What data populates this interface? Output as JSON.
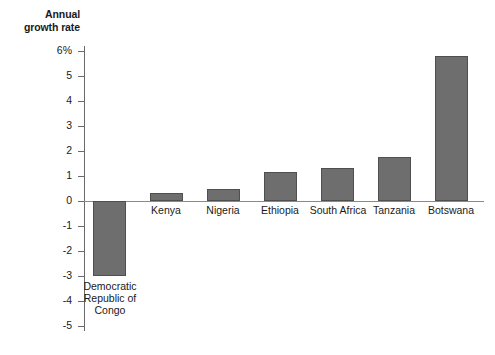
{
  "chart_data": {
    "type": "bar",
    "title": "",
    "axis_title": "Annual\ngrowth rate",
    "axis_title_line1": "Annual",
    "axis_title_line2": "growth rate",
    "xlabel": "",
    "ylabel": "Annual growth rate",
    "ylim": [
      -5,
      6
    ],
    "grid": false,
    "legend": "none",
    "bar_color": "#6e6e6e",
    "bar_edge_color": "#4f4f4f",
    "axis_color": "#6a6a6a",
    "categories": [
      "Democratic\nRepublic of\nCongo",
      "Kenya",
      "Nigeria",
      "Ethiopia",
      "South Africa",
      "Tanzania",
      "Botswana"
    ],
    "values": [
      -3.0,
      0.3,
      0.5,
      1.15,
      1.3,
      1.75,
      5.8
    ],
    "ytick_labels": [
      "6%",
      "5",
      "4",
      "3",
      "2",
      "1",
      "0",
      "-1",
      "-2",
      "-3",
      "-4",
      "-5"
    ],
    "ytick_values": [
      6,
      5,
      4,
      3,
      2,
      1,
      0,
      -1,
      -2,
      -3,
      -4,
      -5
    ]
  },
  "bars": [
    {
      "name": "democratic-republic-of-congo",
      "label": "Democratic\nRepublic of\nCongo",
      "value": -3.0,
      "left": 93,
      "width": 33,
      "top": 201,
      "height": 75,
      "label_left": 76,
      "label_top": 280,
      "label_width": 68
    },
    {
      "name": "kenya",
      "label": "Kenya",
      "value": 0.3,
      "left": 150,
      "width": 33,
      "top": 193,
      "height": 8,
      "label_left": 132,
      "label_top": 204,
      "label_width": 68
    },
    {
      "name": "nigeria",
      "label": "Nigeria",
      "value": 0.5,
      "left": 207,
      "width": 33,
      "top": 189,
      "height": 12,
      "label_left": 189,
      "label_top": 204,
      "label_width": 68
    },
    {
      "name": "ethiopia",
      "label": "Ethiopia",
      "value": 1.15,
      "left": 264,
      "width": 33,
      "top": 172,
      "height": 29,
      "label_left": 246,
      "label_top": 204,
      "label_width": 68
    },
    {
      "name": "south-africa",
      "label": "South Africa",
      "value": 1.3,
      "left": 321,
      "width": 33,
      "top": 168,
      "height": 33,
      "label_left": 299,
      "label_top": 204,
      "label_width": 78
    },
    {
      "name": "tanzania",
      "label": "Tanzania",
      "value": 1.75,
      "left": 378,
      "width": 33,
      "top": 157,
      "height": 44,
      "label_left": 360,
      "label_top": 204,
      "label_width": 68
    },
    {
      "name": "botswana",
      "label": "Botswana",
      "value": 5.8,
      "left": 435,
      "width": 33,
      "top": 56,
      "height": 145,
      "label_left": 417,
      "label_top": 204,
      "label_width": 68
    }
  ],
  "yticks": [
    {
      "label": "6%",
      "y": 51
    },
    {
      "label": "5",
      "y": 76
    },
    {
      "label": "4",
      "y": 101
    },
    {
      "label": "3",
      "y": 126
    },
    {
      "label": "2",
      "y": 151
    },
    {
      "label": "1",
      "y": 176
    },
    {
      "label": "0",
      "y": 201
    },
    {
      "label": "-1",
      "y": 226
    },
    {
      "label": "-2",
      "y": 251
    },
    {
      "label": "-3",
      "y": 276
    },
    {
      "label": "-4",
      "y": 301
    },
    {
      "label": "-5",
      "y": 326
    }
  ]
}
